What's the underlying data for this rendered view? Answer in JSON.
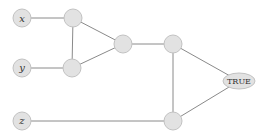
{
  "diagram": {
    "type": "circuit-graph",
    "colors": {
      "node_fill": "#e2e2e2",
      "node_stroke": "#c2c2c2",
      "edge": "#8a8a8a",
      "text": "#333333"
    },
    "nodes": [
      {
        "id": "x",
        "label": "x",
        "kind": "input",
        "cx": 22,
        "cy": 18
      },
      {
        "id": "y",
        "label": "y",
        "kind": "input",
        "cx": 22,
        "cy": 68
      },
      {
        "id": "z",
        "label": "z",
        "kind": "input",
        "cx": 22,
        "cy": 121
      },
      {
        "id": "g1",
        "label": "",
        "kind": "gate",
        "cx": 73,
        "cy": 18
      },
      {
        "id": "g2",
        "label": "",
        "kind": "gate",
        "cx": 72,
        "cy": 68
      },
      {
        "id": "g3",
        "label": "",
        "kind": "gate",
        "cx": 123,
        "cy": 44
      },
      {
        "id": "g4",
        "label": "",
        "kind": "gate",
        "cx": 173,
        "cy": 44
      },
      {
        "id": "g5",
        "label": "",
        "kind": "gate",
        "cx": 173,
        "cy": 121
      },
      {
        "id": "out",
        "label": "TRUE",
        "kind": "output",
        "cx": 239,
        "cy": 81
      }
    ],
    "edges": [
      [
        "x",
        "g1"
      ],
      [
        "y",
        "g2"
      ],
      [
        "g1",
        "g2"
      ],
      [
        "g1",
        "g3"
      ],
      [
        "g2",
        "g3"
      ],
      [
        "g3",
        "g4"
      ],
      [
        "g4",
        "g5"
      ],
      [
        "z",
        "g5"
      ],
      [
        "g4",
        "out"
      ],
      [
        "g5",
        "out"
      ]
    ]
  }
}
